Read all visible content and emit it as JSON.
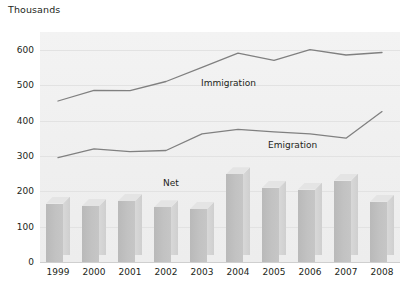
{
  "chart_data": {
    "type": "bar",
    "title": "",
    "ylabel": "Thousands",
    "xlabel": "",
    "ylim": [
      0,
      650
    ],
    "yticks": [
      0,
      100,
      200,
      300,
      400,
      500,
      600
    ],
    "grid": true,
    "legend_position": "inline-annotations",
    "categories": [
      "1999",
      "2000",
      "2001",
      "2002",
      "2003",
      "2004",
      "2005",
      "2006",
      "2007",
      "2008"
    ],
    "series": [
      {
        "name": "Immigration",
        "type": "line",
        "values": [
          455,
          485,
          484,
          510,
          550,
          590,
          570,
          600,
          585,
          592
        ]
      },
      {
        "name": "Emigration",
        "type": "line",
        "values": [
          295,
          320,
          312,
          315,
          362,
          375,
          368,
          362,
          350,
          425
        ]
      },
      {
        "name": "Net",
        "type": "bar",
        "values": [
          165,
          158,
          172,
          155,
          150,
          248,
          210,
          205,
          230,
          170
        ]
      }
    ],
    "annotations": [
      {
        "text": "Immigration",
        "x": 201,
        "y": 78
      },
      {
        "text": "Emigration",
        "x": 268,
        "y": 140
      },
      {
        "text": "Net",
        "x": 163,
        "y": 178
      }
    ],
    "colors": {
      "plot_background": "#f1f1f1",
      "gridline": "#e2e2e2",
      "line": "#808080",
      "bar_face": "#bebebe",
      "bar_side": "#d3d3d3",
      "bar_top": "#e4e4e4",
      "text": "#231f20"
    }
  }
}
